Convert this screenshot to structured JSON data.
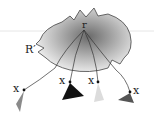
{
  "diagram": {
    "region_label": "R′",
    "root_label": "r",
    "leaves": [
      {
        "label": "x",
        "triangle_color": "#8a8a8a"
      },
      {
        "label": "x",
        "triangle_color": "#111111"
      },
      {
        "label": "x",
        "triangle_color": "#dcdcdc"
      },
      {
        "label": "x",
        "triangle_color": "#555555"
      }
    ],
    "colors": {
      "blob_center": "#6a6a6a",
      "blob_edge": "#f2f2f2",
      "guide_line": "#e6e6e6"
    }
  }
}
